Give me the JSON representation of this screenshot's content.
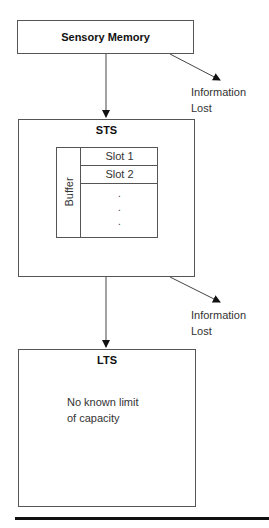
{
  "diagram": {
    "type": "memory-model-flow",
    "nodes": {
      "sensory": {
        "label": "Sensory Memory"
      },
      "sts": {
        "label": "STS",
        "buffer": {
          "label": "Buffer",
          "slots": [
            "Slot 1",
            "Slot 2"
          ],
          "ellipsis": ".\n.\n."
        }
      },
      "lts": {
        "label": "LTS",
        "note_line1": "No known limit",
        "note_line2": "of capacity"
      }
    },
    "loss_labels": [
      {
        "line1": "Information",
        "line2": "Lost"
      },
      {
        "line1": "Information",
        "line2": "Lost"
      }
    ],
    "edges": [
      {
        "from": "Sensory Memory",
        "to": "STS"
      },
      {
        "from": "Sensory Memory",
        "to": "Information Lost"
      },
      {
        "from": "STS",
        "to": "LTS"
      },
      {
        "from": "STS",
        "to": "Information Lost"
      }
    ]
  }
}
